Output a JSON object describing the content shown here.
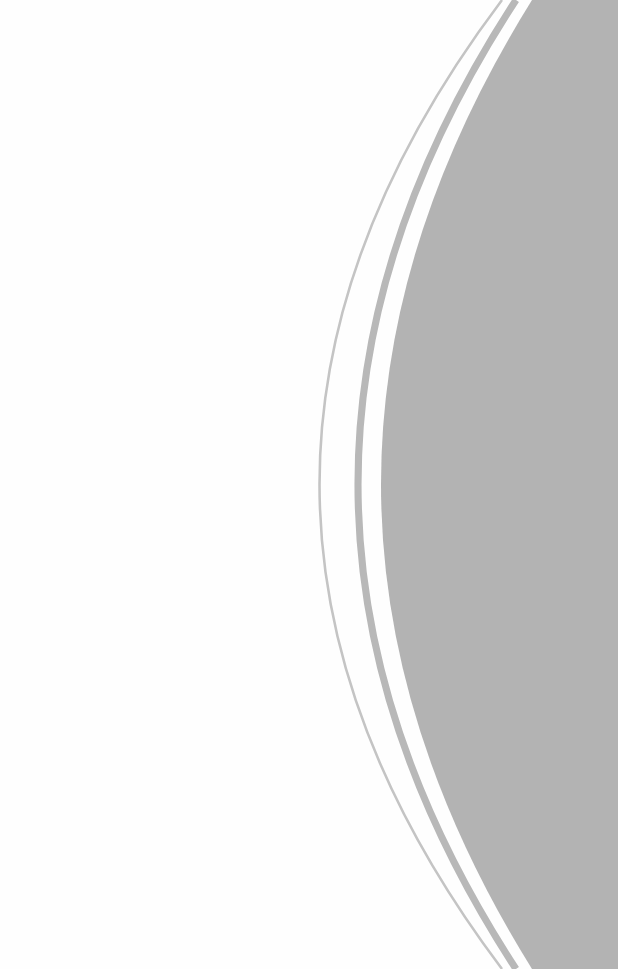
{
  "page": {
    "background": "#fefefe"
  },
  "shape": {
    "fill_color": "#b3b3b3",
    "stripe_color": "#b8b8b8",
    "thin_line_color": "#c4c4c4"
  }
}
